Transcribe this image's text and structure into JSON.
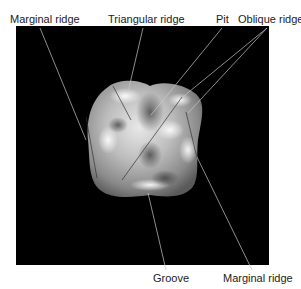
{
  "figure": {
    "background_color": "#000000",
    "labels": [
      {
        "id": "marginal-ridge-left",
        "text": "Marginal ridge"
      },
      {
        "id": "triangular-ridge",
        "text": "Triangular ridge"
      },
      {
        "id": "pit",
        "text": "Pit"
      },
      {
        "id": "oblique-ridge",
        "text": "Oblique ridge"
      },
      {
        "id": "groove",
        "text": "Groove"
      },
      {
        "id": "marginal-ridge-right",
        "text": "Marginal ridge"
      }
    ]
  }
}
